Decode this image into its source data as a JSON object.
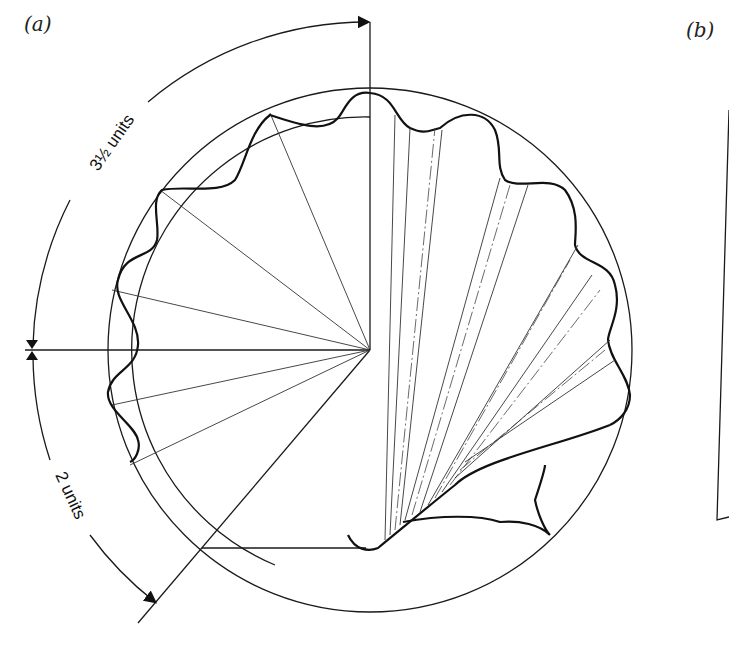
{
  "figure": {
    "panels": [
      {
        "id": "a",
        "label": "(a)"
      },
      {
        "id": "b",
        "label": "(b)"
      }
    ],
    "dimensions": {
      "upper_arc_label": "3½ units",
      "lower_arc_label": "2 units"
    },
    "colors": {
      "line": "#1a1a1a",
      "background": "#ffffff"
    }
  }
}
